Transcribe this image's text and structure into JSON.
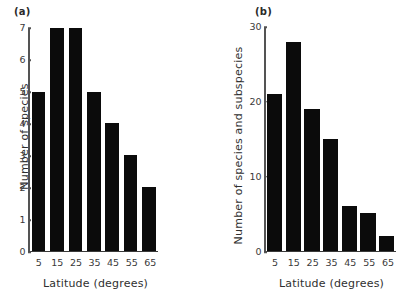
{
  "figure": {
    "background": "#ffffff",
    "bar_color": "#0b0b0b",
    "axis_color": "#545454"
  },
  "panels": [
    {
      "tag": "(a)",
      "xlabel": "Latitude (degrees)",
      "ylabel": "Number of species",
      "yticks": [
        "0",
        "1",
        "2",
        "3",
        "4",
        "5",
        "6",
        "7"
      ],
      "xticks": [
        "5",
        "15",
        "25",
        "35",
        "45",
        "55",
        "65"
      ]
    },
    {
      "tag": "(b)",
      "xlabel": "Latitude (degrees)",
      "ylabel": "Number of species and subspecies",
      "yticks": [
        "0",
        "10",
        "20",
        "30"
      ],
      "xticks": [
        "5",
        "15",
        "25",
        "35",
        "45",
        "55",
        "65"
      ]
    }
  ],
  "chart_data": [
    {
      "type": "bar",
      "panel": "(a)",
      "title": "",
      "categories": [
        "5",
        "15",
        "25",
        "35",
        "45",
        "55",
        "65"
      ],
      "values": [
        5,
        7,
        7,
        5,
        4,
        3,
        2
      ],
      "xlabel": "Latitude (degrees)",
      "ylabel": "Number of species",
      "ylim": [
        0,
        7
      ],
      "ytick_values": [
        0,
        1,
        2,
        3,
        4,
        5,
        6,
        7
      ],
      "grid": false,
      "legend": false
    },
    {
      "type": "bar",
      "panel": "(b)",
      "title": "",
      "categories": [
        "5",
        "15",
        "25",
        "35",
        "45",
        "55",
        "65"
      ],
      "values": [
        21,
        28,
        19,
        15,
        6,
        5,
        2
      ],
      "xlabel": "Latitude (degrees)",
      "ylabel": "Number of species and subspecies",
      "ylim": [
        0,
        30
      ],
      "ytick_values": [
        0,
        10,
        20,
        30
      ],
      "grid": false,
      "legend": false
    }
  ]
}
